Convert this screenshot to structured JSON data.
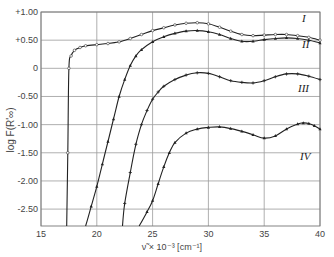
{
  "chart_data": {
    "type": "line",
    "title": "",
    "xlabel": "ν̃ × 10⁻³ [cm⁻¹]",
    "ylabel": "log F(R'∞)",
    "xlim": [
      15,
      40
    ],
    "ylim": [
      -2.8,
      1.0
    ],
    "grid": true,
    "legend": "inline labels at right end of curves",
    "x_ticks": [
      "15",
      "20",
      "25",
      "30",
      "35",
      "40"
    ],
    "x_tick_values": [
      15,
      20,
      25,
      30,
      35,
      40
    ],
    "y_ticks": [
      "+1.00",
      "+0.50",
      "0",
      "-0.50",
      "-1.00",
      "-1.50",
      "-2.00",
      "-2.50"
    ],
    "y_tick_values": [
      1.0,
      0.5,
      0,
      -0.5,
      -1.0,
      -1.5,
      -2.0,
      -2.5
    ],
    "series": [
      {
        "name": "I",
        "marker": "open-circle",
        "x": [
          17.3,
          17.4,
          17.5,
          17.7,
          18.0,
          18.5,
          19.0,
          20.0,
          21.0,
          22.0,
          23.0,
          24.0,
          25.0,
          26.0,
          27.0,
          28.0,
          29.0,
          30.0,
          31.0,
          32.0,
          33.0,
          34.0,
          35.0,
          36.0,
          37.0,
          38.0,
          39.0,
          40.0
        ],
        "y": [
          -2.8,
          -1.5,
          0.0,
          0.22,
          0.32,
          0.37,
          0.4,
          0.42,
          0.44,
          0.47,
          0.53,
          0.6,
          0.67,
          0.72,
          0.77,
          0.8,
          0.81,
          0.79,
          0.73,
          0.66,
          0.6,
          0.58,
          0.59,
          0.6,
          0.6,
          0.58,
          0.55,
          0.5
        ]
      },
      {
        "name": "II",
        "marker": "filled-triangle",
        "x": [
          19.0,
          19.5,
          20.0,
          20.5,
          21.0,
          21.5,
          22.0,
          22.5,
          23.0,
          23.5,
          24.0,
          25.0,
          26.0,
          27.0,
          28.0,
          29.0,
          30.0,
          31.0,
          32.0,
          33.0,
          34.0,
          35.0,
          36.0,
          37.0,
          38.0,
          39.0,
          40.0
        ],
        "y": [
          -2.8,
          -2.45,
          -2.1,
          -1.7,
          -1.3,
          -0.9,
          -0.5,
          -0.2,
          0.05,
          0.22,
          0.33,
          0.47,
          0.56,
          0.62,
          0.66,
          0.67,
          0.65,
          0.6,
          0.53,
          0.48,
          0.48,
          0.51,
          0.53,
          0.54,
          0.53,
          0.5,
          0.45
        ]
      },
      {
        "name": "III",
        "marker": "plus",
        "x": [
          22.3,
          22.5,
          23.0,
          23.5,
          24.0,
          24.5,
          25.0,
          25.5,
          26.0,
          27.0,
          28.0,
          29.0,
          30.0,
          31.0,
          32.0,
          33.0,
          34.0,
          35.0,
          36.0,
          37.0,
          38.0,
          39.0,
          40.0
        ],
        "y": [
          -2.8,
          -2.4,
          -1.85,
          -1.35,
          -1.0,
          -0.75,
          -0.55,
          -0.42,
          -0.32,
          -0.2,
          -0.12,
          -0.08,
          -0.09,
          -0.15,
          -0.22,
          -0.25,
          -0.26,
          -0.22,
          -0.15,
          -0.1,
          -0.1,
          -0.14,
          -0.2
        ]
      },
      {
        "name": "IV",
        "marker": "filled-triangle",
        "x": [
          23.8,
          24.5,
          25.0,
          25.5,
          26.0,
          26.5,
          27.0,
          28.0,
          29.0,
          30.0,
          31.0,
          32.0,
          33.0,
          34.0,
          35.0,
          36.0,
          37.0,
          38.0,
          38.5,
          39.0,
          39.5,
          40.0
        ],
        "y": [
          -2.8,
          -2.55,
          -2.35,
          -2.05,
          -1.75,
          -1.5,
          -1.32,
          -1.15,
          -1.08,
          -1.05,
          -1.04,
          -1.07,
          -1.12,
          -1.18,
          -1.24,
          -1.2,
          -1.08,
          -0.99,
          -0.97,
          -0.98,
          -1.02,
          -1.08
        ]
      }
    ]
  },
  "axes": {
    "y_label_text": "log F(R'∞)",
    "x_label_text": "ν̃ × 10⁻³ [cm⁻¹]"
  }
}
